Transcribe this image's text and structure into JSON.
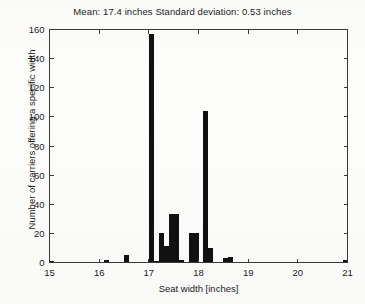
{
  "chart_data": {
    "type": "bar",
    "title": "Mean: 17.4 inches   Standard deviation: 0.53 inches",
    "title_parts": {
      "mean_label": "Mean: 17.4 inches",
      "std_label": "Standard deviation: 0.53 inches"
    },
    "xlabel": "Seat width [inches]",
    "ylabel": "Number of carriers offering a specific width",
    "xlim": [
      15,
      21
    ],
    "ylim": [
      0,
      160
    ],
    "xticks": [
      15,
      16,
      17,
      18,
      19,
      20,
      21
    ],
    "xtick_labels": [
      "15",
      "16",
      "17",
      "18",
      "19",
      "20",
      "21"
    ],
    "yticks": [
      0,
      20,
      40,
      60,
      80,
      100,
      120,
      140,
      160
    ],
    "ytick_labels": [
      "0",
      "20",
      "40",
      "60",
      "80",
      "100",
      "120",
      "140",
      "160"
    ],
    "grid": false,
    "legend": null,
    "bar_color": "#111111",
    "bin_width": 0.1,
    "x": [
      15.0,
      15.1,
      15.2,
      15.3,
      15.4,
      15.5,
      15.6,
      15.7,
      15.8,
      15.9,
      16.0,
      16.1,
      16.2,
      16.3,
      16.4,
      16.5,
      16.6,
      16.7,
      16.8,
      16.9,
      17.0,
      17.1,
      17.2,
      17.3,
      17.4,
      17.5,
      17.6,
      17.7,
      17.8,
      17.9,
      18.0,
      18.1,
      18.2,
      18.3,
      18.4,
      18.5,
      18.6,
      18.7,
      18.8,
      18.9,
      19.0,
      19.1,
      19.2,
      19.3,
      19.4,
      19.5,
      19.6,
      19.7,
      19.8,
      19.9,
      20.0,
      20.1,
      20.2,
      20.3,
      20.4,
      20.5,
      20.6,
      20.7,
      20.8,
      20.9
    ],
    "values": [
      1,
      0,
      0,
      0,
      0,
      0,
      0,
      0,
      0,
      0,
      0,
      2,
      0,
      0,
      0,
      5,
      0,
      0,
      0,
      0,
      157,
      1,
      20,
      11,
      33,
      33,
      2,
      0,
      20,
      20,
      0,
      104,
      10,
      0,
      0,
      3,
      4,
      0,
      0,
      0,
      0,
      0,
      0,
      0,
      0,
      0,
      0,
      0,
      0,
      0,
      0,
      0,
      0,
      0,
      0,
      0,
      0,
      0,
      0,
      2
    ]
  }
}
